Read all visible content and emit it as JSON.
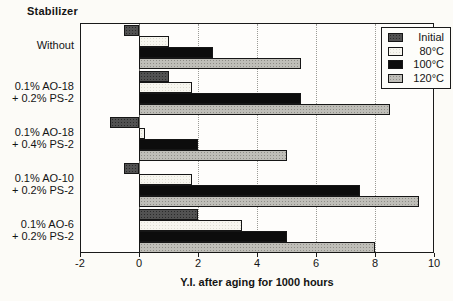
{
  "figure": {
    "stabilizer_label": "Stabilizer"
  },
  "chart_data": {
    "type": "bar",
    "orientation": "horizontal",
    "xlabel": "Y.I. after aging for 1000 hours",
    "ylabel": "Stabilizer",
    "xlim": [
      -2,
      10
    ],
    "xticks": [
      -2,
      0,
      2,
      4,
      6,
      8,
      10
    ],
    "grid": true,
    "legend_position": "top-right",
    "categories": [
      "Without",
      "0.1% AO-18 + 0.2% PS-2",
      "0.1% AO-18 + 0.4% PS-2",
      "0.1% AO-10 + 0.2% PS-2",
      "0.1% AO-6 + 0.2% PS-2"
    ],
    "categories_lines": [
      [
        "Without"
      ],
      [
        "0.1% AO-18",
        "+ 0.2% PS-2"
      ],
      [
        "0.1% AO-18",
        "+ 0.4% PS-2"
      ],
      [
        "0.1% AO-10",
        "+ 0.2% PS-2"
      ],
      [
        "0.1% AO-6",
        "+ 0.2% PS-2"
      ]
    ],
    "series": [
      {
        "name": "Initial",
        "color": "#525252",
        "dot_color": "#2a2a2a",
        "values": [
          -0.5,
          1.0,
          -1.0,
          -0.5,
          2.0
        ]
      },
      {
        "name": "80°C",
        "color": "#f7f6ef",
        "dot_color": "#dddcd2",
        "values": [
          1.0,
          1.8,
          0.2,
          1.8,
          3.5
        ]
      },
      {
        "name": "100°C",
        "color": "#0c0c0c",
        "dot_color": null,
        "values": [
          2.5,
          5.5,
          2.0,
          7.5,
          5.0
        ]
      },
      {
        "name": "120°C",
        "color": "#bfbeb8",
        "dot_color": "#8e8d87",
        "values": [
          5.5,
          8.5,
          5.0,
          9.5,
          8.0
        ]
      }
    ]
  },
  "colors": {
    "plot_border": "#1a1a1a",
    "grid": "#9b9b96",
    "zero_line": "#6f6f6a",
    "background": "#fcfbf7",
    "bar_outline": "#161616"
  }
}
